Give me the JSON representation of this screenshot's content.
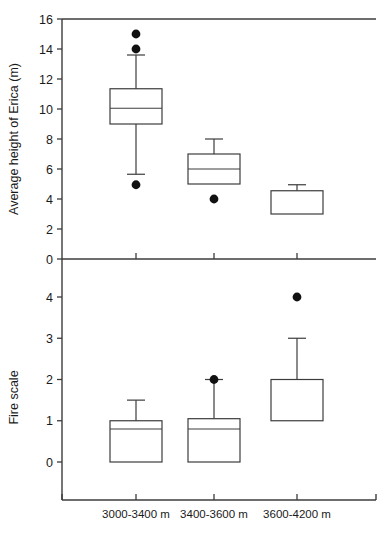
{
  "figure": {
    "title": "",
    "panels": [
      "top",
      "bottom"
    ]
  },
  "chart_data": [
    {
      "type": "box",
      "panel": "top",
      "title": "",
      "xlabel": "",
      "ylabel": "Average height of Erica (m)",
      "ylim": [
        0,
        16
      ],
      "yticks": [
        0,
        2,
        4,
        6,
        8,
        10,
        12,
        14,
        16
      ],
      "ytick_labels": [
        "0",
        "2",
        "4",
        "6",
        "8",
        "10",
        "12",
        "14",
        "16"
      ],
      "grid": false,
      "legend": "none",
      "categories": [
        "3000-3400 m",
        "3400-3600 m",
        "3600-4200 m"
      ],
      "boxes": [
        {
          "category": "3000-3400 m",
          "whisker_low": 5.65,
          "q1": 9.0,
          "median": 10.05,
          "q3": 11.35,
          "whisker_high": 13.6,
          "outliers": [
            4.95,
            14.0,
            15.0
          ]
        },
        {
          "category": "3400-3600 m",
          "whisker_low": 5.0,
          "q1": 5.0,
          "median": 6.0,
          "q3": 7.0,
          "whisker_high": 8.0,
          "outliers": [
            4.0
          ]
        },
        {
          "category": "3600-4200 m",
          "whisker_low": 3.0,
          "q1": 3.0,
          "median": 4.55,
          "q3": 4.55,
          "whisker_high": 4.95,
          "outliers": []
        }
      ]
    },
    {
      "type": "box",
      "panel": "bottom",
      "title": "",
      "xlabel": "",
      "ylabel": "Fire scale",
      "ylim": [
        -0.55,
        4.75
      ],
      "yticks": [
        0,
        1,
        2,
        3,
        4
      ],
      "ytick_labels": [
        "0",
        "1",
        "2",
        "3",
        "4"
      ],
      "grid": false,
      "legend": "none",
      "categories": [
        "3000-3400 m",
        "3400-3600 m",
        "3600-4200 m"
      ],
      "boxes": [
        {
          "category": "3000-3400 m",
          "whisker_low": 0.0,
          "q1": 0.0,
          "median": 0.8,
          "q3": 1.0,
          "whisker_high": 1.5,
          "outliers": []
        },
        {
          "category": "3400-3600 m",
          "whisker_low": 0.0,
          "q1": 0.0,
          "median": 0.8,
          "q3": 1.05,
          "whisker_high": 2.0,
          "outliers": [
            2.0
          ]
        },
        {
          "category": "3600-4200 m",
          "whisker_low": 1.0,
          "q1": 1.0,
          "median": 2.0,
          "q3": 2.0,
          "whisker_high": 3.0,
          "outliers": [
            4.0
          ]
        }
      ]
    }
  ],
  "axes": {
    "top": {
      "ylabel": "Average height of Erica (m)",
      "tick_labels": [
        "16",
        "14",
        "12",
        "10",
        "8",
        "6",
        "4",
        "2",
        "0"
      ]
    },
    "bottom": {
      "ylabel": "Fire scale",
      "tick_labels": [
        "4",
        "3",
        "2",
        "1",
        "0"
      ]
    },
    "x": {
      "categories": [
        "3000-3400 m",
        "3400-3600 m",
        "3600-4200 m"
      ]
    }
  },
  "style": {
    "line_color": "#3c3c3c",
    "outlier_color": "#111111",
    "background": "#ffffff"
  }
}
